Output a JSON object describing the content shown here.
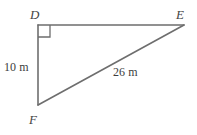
{
  "figure": {
    "type": "right-triangle-diagram",
    "background_color": "#ffffff",
    "stroke_color": "#6e6e6e",
    "text_color": "#3d3d3d",
    "width": 197,
    "height": 135,
    "vertices": [
      {
        "name": "D",
        "label": "D",
        "x": 38,
        "y": 25,
        "right_angle": true
      },
      {
        "name": "E",
        "label": "E",
        "x": 184,
        "y": 25,
        "right_angle": false
      },
      {
        "name": "F",
        "label": "F",
        "x": 38,
        "y": 105,
        "right_angle": false
      }
    ],
    "edges": [
      {
        "name": "DE",
        "from": "D",
        "to": "E",
        "label": "",
        "x1": 38,
        "y1": 25,
        "x2": 184,
        "y2": 25
      },
      {
        "name": "DF",
        "from": "D",
        "to": "F",
        "label": "10 m",
        "x1": 38,
        "y1": 25,
        "x2": 38,
        "y2": 105
      },
      {
        "name": "FE",
        "from": "F",
        "to": "E",
        "label": "26 m",
        "x1": 38,
        "y1": 105,
        "x2": 184,
        "y2": 25
      }
    ],
    "right_angle_marker": {
      "at_vertex": "D",
      "size": 12,
      "x": 38,
      "y": 25
    },
    "labels": {
      "vertex_D": "D",
      "vertex_E": "E",
      "vertex_F": "F",
      "leg_DF": "10 m",
      "hypotenuse_FE": "26 m"
    }
  }
}
